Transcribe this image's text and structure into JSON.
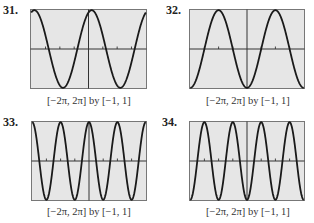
{
  "chart_data": [
    {
      "type": "line",
      "label": "31.",
      "caption": "[−2π, 2π] by [−1, 1]",
      "xlim": [
        -6.2832,
        6.2832
      ],
      "ylim": [
        -1,
        1
      ],
      "function": "y = cos(x − 0.35)",
      "amplitude": 1,
      "period": 6.2832,
      "phase": 0.35,
      "sign": 1,
      "freq": 1,
      "x_tick_count_per_side": 3,
      "grid": false,
      "background": "#e6e6e6"
    },
    {
      "type": "line",
      "label": "32.",
      "caption": "[−2π, 2π] by [−1, 1]",
      "xlim": [
        -6.2832,
        6.2832
      ],
      "ylim": [
        -1,
        1
      ],
      "function": "y = −cos(x)",
      "amplitude": 1,
      "period": 6.2832,
      "phase": 0,
      "sign": -1,
      "freq": 1,
      "x_tick_count_per_side": 3,
      "grid": false,
      "background": "#e6e6e6"
    },
    {
      "type": "line",
      "label": "33.",
      "caption": "[−2π, 2π] by [−1, 1]",
      "xlim": [
        -6.2832,
        6.2832
      ],
      "ylim": [
        -1,
        1
      ],
      "function": "y = cos(2x)",
      "amplitude": 1,
      "period": 3.1416,
      "phase": 0,
      "sign": 1,
      "freq": 2,
      "x_tick_count_per_side": 3,
      "grid": false,
      "background": "#e6e6e6"
    },
    {
      "type": "line",
      "label": "34.",
      "caption": "[−2π, 2π] by [−1, 1]",
      "xlim": [
        -6.2832,
        6.2832
      ],
      "ylim": [
        -1,
        1
      ],
      "function": "y = −cos(2x)",
      "amplitude": 1,
      "period": 3.1416,
      "phase": 0,
      "sign": -1,
      "freq": 2,
      "x_tick_count_per_side": 3,
      "grid": false,
      "background": "#e6e6e6"
    }
  ],
  "panels": [
    {
      "number": "31.",
      "caption": "[−2π, 2π] by [−1, 1]"
    },
    {
      "number": "32.",
      "caption": "[−2π, 2π] by [−1, 1]"
    },
    {
      "number": "33.",
      "caption": "[−2π, 2π] by [−1, 1]"
    },
    {
      "number": "34.",
      "caption": "[−2π, 2π] by [−1, 1]"
    }
  ]
}
